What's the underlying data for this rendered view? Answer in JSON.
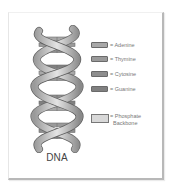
{
  "diagram": {
    "title": "DNA",
    "legend": [
      {
        "label": "= Adenine",
        "color": "#a8a8a8"
      },
      {
        "label": "= Thymine",
        "color": "#9a9a9a"
      },
      {
        "label": "= Cytosine",
        "color": "#8e8e8e"
      },
      {
        "label": "= Guanine",
        "color": "#808080"
      }
    ],
    "backbone": {
      "label_line1": "= Phosphate",
      "label_line2": "Backbone",
      "color": "#d8d8d8"
    }
  }
}
